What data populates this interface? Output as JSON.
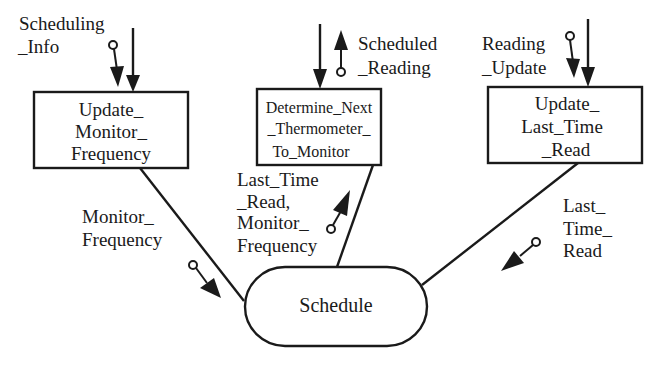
{
  "diagram": {
    "modules": [
      {
        "id": "update_monitor_frequency",
        "lines": [
          "Update_",
          "Monitor_",
          "Frequency"
        ]
      },
      {
        "id": "determine_next_thermometer",
        "lines": [
          "Determine_Next",
          "_Thermometer_",
          "To_Monitor"
        ]
      },
      {
        "id": "update_last_time_read",
        "lines": [
          "Update_",
          "Last_Time",
          "_Read"
        ]
      }
    ],
    "central": {
      "id": "schedule",
      "label": "Schedule"
    },
    "data_flows": [
      {
        "lines": [
          "Scheduling",
          "_Info"
        ],
        "direction": "in",
        "target": "update_monitor_frequency"
      },
      {
        "lines": [
          "Scheduled",
          "_Reading"
        ],
        "direction": "out",
        "source": "determine_next_thermometer"
      },
      {
        "lines": [
          "Reading",
          "_Update"
        ],
        "direction": "in",
        "target": "update_last_time_read"
      },
      {
        "lines": [
          "Monitor_",
          "Frequency"
        ],
        "direction": "down",
        "from": "update_monitor_frequency",
        "to": "schedule"
      },
      {
        "lines": [
          "Last_Time",
          "_Read,",
          "Monitor_",
          "Frequency"
        ],
        "direction": "up",
        "from": "schedule",
        "to": "determine_next_thermometer"
      },
      {
        "lines": [
          "Last_",
          "Time_",
          "Read"
        ],
        "direction": "down",
        "from": "update_last_time_read",
        "to": "schedule"
      }
    ]
  }
}
